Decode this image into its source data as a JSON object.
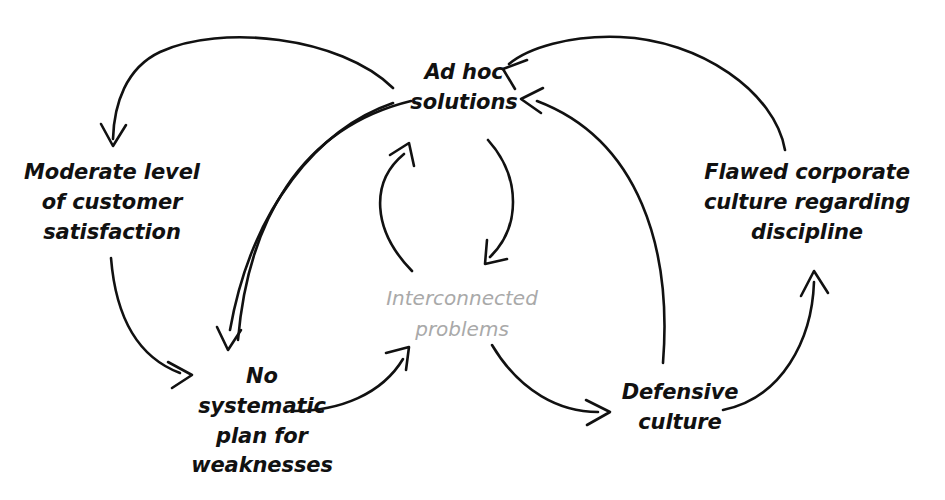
{
  "diagram": {
    "title": "Interconnected problems",
    "background_color": "#ffffff",
    "stroke_color": "#111111",
    "center_label_color": "#a9a9a9",
    "nodes": [
      {
        "id": "ad_hoc",
        "label": "Ad hoc\nsolutions"
      },
      {
        "id": "moderate",
        "label": "Moderate level\nof customer\nsatisfaction"
      },
      {
        "id": "flawed",
        "label": "Flawed corporate\nculture regarding\ndiscipline"
      },
      {
        "id": "no_plan",
        "label": "No\nsystematic\nplan for\nweaknesses"
      },
      {
        "id": "defensive",
        "label": "Defensive\nculture"
      }
    ],
    "center_label": "Interconnected\nproblems",
    "edges": [
      {
        "id": "e1",
        "from": "ad_hoc",
        "to": "moderate",
        "arrowhead": true
      },
      {
        "id": "e2",
        "from": "ad_hoc",
        "to": "no_plan",
        "arrowhead": true
      },
      {
        "id": "e3",
        "from": "no_plan",
        "to": "ad_hoc",
        "arrowhead": false
      },
      {
        "id": "e4",
        "from": "moderate",
        "to": "no_plan",
        "arrowhead": true
      },
      {
        "id": "e5",
        "from": "no_plan",
        "to": "center",
        "arrowhead": true
      },
      {
        "id": "e6",
        "from": "center",
        "to": "ad_hoc",
        "arrowhead": true
      },
      {
        "id": "e7",
        "from": "ad_hoc",
        "to": "center",
        "arrowhead": true
      },
      {
        "id": "e8",
        "from": "center",
        "to": "defensive",
        "arrowhead": true
      },
      {
        "id": "e9",
        "from": "defensive",
        "to": "ad_hoc",
        "arrowhead": true
      },
      {
        "id": "e10",
        "from": "defensive",
        "to": "flawed",
        "arrowhead": true
      },
      {
        "id": "e11",
        "from": "flawed",
        "to": "ad_hoc",
        "arrowhead": true
      }
    ]
  }
}
